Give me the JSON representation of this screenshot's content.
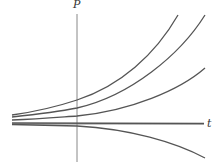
{
  "diagram": {
    "type": "solution-curves",
    "axes": {
      "vertical_label": "P",
      "horizontal_label": "t"
    },
    "curves": [
      {
        "name": "curve-1",
        "behavior": "growing"
      },
      {
        "name": "curve-2",
        "behavior": "growing"
      },
      {
        "name": "curve-3",
        "behavior": "growing"
      },
      {
        "name": "curve-4",
        "behavior": "equilibrium"
      },
      {
        "name": "curve-5",
        "behavior": "decaying"
      }
    ],
    "colors": {
      "axis": "#888888",
      "curve": "#555555",
      "background": "#ffffff"
    }
  }
}
